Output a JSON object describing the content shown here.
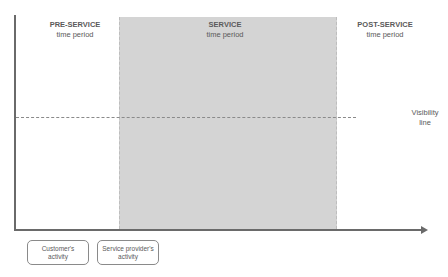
{
  "diagram": {
    "periods": [
      {
        "title": "PRE-SERVICE",
        "subtitle": "time period"
      },
      {
        "title": "SERVICE",
        "subtitle": "time period"
      },
      {
        "title": "POST-SERVICE",
        "subtitle": "time period"
      }
    ],
    "visibility_line": {
      "line1": "Visibility",
      "line2": "line"
    },
    "legend": [
      {
        "line1": "Customer's",
        "line2": "activity"
      },
      {
        "line1": "Service provider's",
        "line2": "activity"
      }
    ],
    "colors": {
      "service_region": "#d4d4d4",
      "axis": "#6a6a6a",
      "visibility_line": "#8a8a8a",
      "text": "#5a5a5a"
    }
  }
}
